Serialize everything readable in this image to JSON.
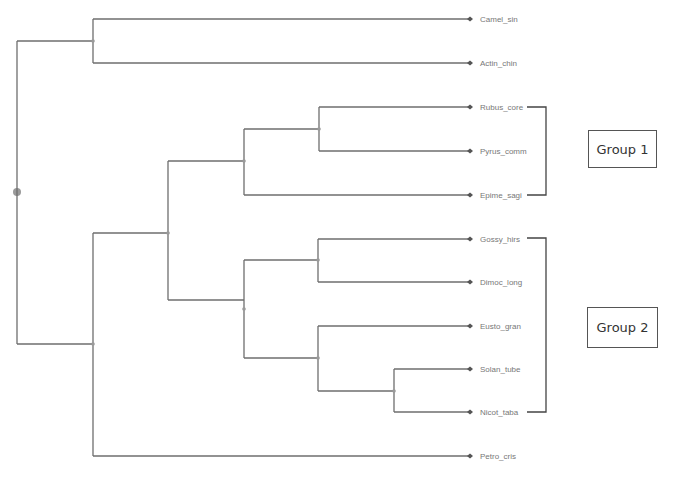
{
  "diagram": {
    "type": "dendrogram",
    "leaves": [
      "Camel_sin",
      "Actin_chin",
      "Rubus_core",
      "Pyrus_comm",
      "Epime_sagi",
      "Gossy_hirs",
      "Dimoc_long",
      "Eusto_gran",
      "Solan_tube",
      "Nicot_taba",
      "Petro_cris"
    ],
    "tree": [
      "root",
      [
        [
          "Camel_sin",
          "Actin_chin"
        ],
        [
          [
            [
              [
                "Rubus_core",
                "Pyrus_comm"
              ],
              "Epime_sagi"
            ],
            [
              [
                "Gossy_hirs",
                "Dimoc_long"
              ],
              [
                "Eusto_gran",
                [
                  "Solan_tube",
                  "Nicot_taba"
                ]
              ]
            ]
          ],
          "Petro_cris"
        ]
      ]
    ],
    "groups": [
      {
        "label": "Group 1",
        "members": [
          "Rubus_core",
          "Pyrus_comm",
          "Epime_sagi"
        ]
      },
      {
        "label": "Group 2",
        "members": [
          "Gossy_hirs",
          "Dimoc_long",
          "Eusto_gran",
          "Solan_tube",
          "Nicot_taba"
        ]
      }
    ]
  }
}
